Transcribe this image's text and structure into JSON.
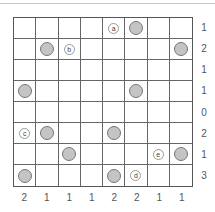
{
  "puzzle": {
    "rows": 8,
    "cols": 8,
    "row_clues": [
      "1",
      "2",
      "1",
      "1",
      "0",
      "2",
      "1",
      "3"
    ],
    "col_clues": [
      "2",
      "1",
      "1",
      "1",
      "2",
      "2",
      "1",
      "1"
    ],
    "disks": [
      [
        0,
        5
      ],
      [
        1,
        1
      ],
      [
        1,
        7
      ],
      [
        3,
        0
      ],
      [
        3,
        5
      ],
      [
        5,
        1
      ],
      [
        5,
        4
      ],
      [
        6,
        2
      ],
      [
        6,
        7
      ],
      [
        7,
        0
      ],
      [
        7,
        4
      ]
    ],
    "labels": [
      {
        "row": 0,
        "col": 4,
        "text": "a"
      },
      {
        "row": 1,
        "col": 2,
        "text": "b"
      },
      {
        "row": 5,
        "col": 0,
        "text": "c"
      },
      {
        "row": 7,
        "col": 5,
        "text": "d"
      },
      {
        "row": 6,
        "col": 6,
        "text": "e"
      }
    ]
  }
}
